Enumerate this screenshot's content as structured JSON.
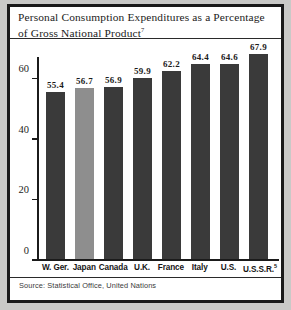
{
  "figure": {
    "title_text": "Personal Consumption Expenditures as a Percentage of Gross National Product",
    "title_superscript": "7",
    "source": "Source: Statistical Office, United Nations"
  },
  "chart_data": {
    "type": "bar",
    "title": "Personal Consumption Expenditures as a Percentage of Gross National Product",
    "categories": [
      "W. Ger.",
      "Japan",
      "Canada",
      "U.K.",
      "France",
      "Italy",
      "U.S.",
      "U.S.S.R."
    ],
    "category_superscripts": [
      "",
      "",
      "",
      "",
      "",
      "",
      "",
      "5"
    ],
    "values": [
      55.4,
      56.7,
      56.9,
      59.9,
      62.2,
      64.4,
      64.6,
      67.9
    ],
    "value_labels": [
      "55.4",
      "56.7",
      "56.9",
      "59.9",
      "62.2",
      "64.4",
      "64.6",
      "67.9"
    ],
    "bar_colors": [
      "#3a3a3a",
      "#8e8e8e",
      "#3a3a3a",
      "#3a3a3a",
      "#3a3a3a",
      "#3a3a3a",
      "#3a3a3a",
      "#3a3a3a"
    ],
    "xlabel": "",
    "ylabel": "",
    "ylim": [
      0,
      72
    ],
    "yticks": [
      0,
      20,
      40,
      60
    ],
    "ytick_labels": [
      "0",
      "20",
      "40",
      "60"
    ],
    "grid": false,
    "legend": null
  }
}
